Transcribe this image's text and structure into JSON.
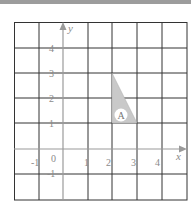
{
  "diagram": {
    "type": "coordinate-grid",
    "axes": {
      "x_label": "x",
      "y_label": "y",
      "origin_label": "0",
      "x_ticks": [
        "-1",
        "1",
        "2",
        "3",
        "4"
      ],
      "y_ticks": [
        "4",
        "3",
        "2",
        "1",
        "-1"
      ]
    },
    "grid": {
      "x_range": [
        -2,
        5
      ],
      "y_range": [
        -2,
        5
      ]
    },
    "shapes": [
      {
        "label": "A",
        "kind": "triangle",
        "vertices": [
          [
            2,
            3
          ],
          [
            2,
            1
          ],
          [
            3,
            1
          ]
        ],
        "fill": "#c9c9c9"
      }
    ],
    "colors": {
      "grid_line": "#333333",
      "axis_line": "#9a9a9a",
      "tick_text": "#8a8a8a",
      "top_band": "#9c9c9c"
    }
  }
}
